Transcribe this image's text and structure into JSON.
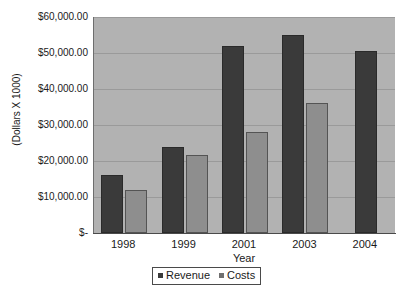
{
  "chart_data": {
    "type": "bar",
    "title": "",
    "xlabel": "Year",
    "ylabel": "(Dollars X 1000)",
    "categories": [
      "1998",
      "1999",
      "2001",
      "2003",
      "2004"
    ],
    "series": [
      {
        "name": "Revenue",
        "color": "#3a3a3a",
        "values": [
          16000,
          24000,
          52000,
          55000,
          50500
        ]
      },
      {
        "name": "Costs",
        "color": "#8e8e8e",
        "values": [
          12000,
          21800,
          28000,
          36000,
          null
        ]
      }
    ],
    "ylim": [
      0,
      60000
    ],
    "yticks": [
      0,
      10000,
      20000,
      30000,
      40000,
      50000,
      60000
    ],
    "ytick_labels": [
      "$-",
      "$10,000.00",
      "$20,000.00",
      "$30,000.00",
      "$40,000.00",
      "$50,000.00",
      "$60,000.00"
    ],
    "grid": true,
    "legend_position": "bottom",
    "legend": [
      "Revenue",
      "Costs"
    ],
    "plot_background": "#b2b2b2",
    "page_background": "#ffffff"
  }
}
